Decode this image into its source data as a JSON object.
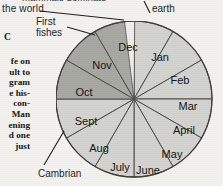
{
  "page": {
    "background_color": "#f3f2ef",
    "ink_color": "#1d1d1b"
  },
  "body_text": {
    "clipped_top_line": "mammals dominate",
    "visible_line": "the world."
  },
  "left_column": {
    "stray_letter": "C",
    "lines": [
      "fe  on",
      "ult  to",
      "gram",
      "e  his-",
      "con-",
      "Man",
      "ening",
      "d  one",
      "just"
    ]
  },
  "callouts": [
    {
      "name": "earth",
      "label": "earth"
    },
    {
      "name": "first-fishes",
      "label_line1": "First",
      "label_line2": "fishes"
    },
    {
      "name": "cambrian",
      "label": "Cambrian"
    }
  ],
  "chart_data": {
    "type": "pie",
    "title": "",
    "legend_position": "in-slice",
    "note": "Geologic time compressed into one calendar year; twelve equal monthly slices.",
    "slice_value": 1,
    "total": 12,
    "start_angle_deg": -90,
    "direction": "clockwise",
    "categories": [
      "Jan",
      "Feb",
      "Mar",
      "April",
      "May",
      "June",
      "July",
      "Aug",
      "Sept",
      "Oct",
      "Nov",
      "Dec"
    ],
    "values": [
      1,
      1,
      1,
      1,
      1,
      1,
      1,
      1,
      1,
      1,
      1,
      1
    ],
    "percentages": [
      8.33,
      8.33,
      8.33,
      8.33,
      8.33,
      8.33,
      8.33,
      8.33,
      8.33,
      8.33,
      8.33,
      8.33
    ],
    "colors": {
      "light": "#d2d2ce",
      "dark": "#a8a8a2",
      "highlight": "#efeeea",
      "stroke": "#4d4d4a"
    },
    "slices": [
      {
        "label": "Jan",
        "value": 1,
        "shade": "light",
        "fill": "#d2d2ce",
        "label_x": 104,
        "label_y": 37
      },
      {
        "label": "Feb",
        "value": 1,
        "shade": "light",
        "fill": "#d2d2ce",
        "label_x": 124,
        "label_y": 60
      },
      {
        "label": "Mar",
        "value": 1,
        "shade": "light",
        "fill": "#d2d2ce",
        "label_x": 132,
        "label_y": 86
      },
      {
        "label": "April",
        "value": 1,
        "shade": "light",
        "fill": "#d2d2ce",
        "label_x": 128,
        "label_y": 110
      },
      {
        "label": "May",
        "value": 1,
        "shade": "light",
        "fill": "#d2d2ce",
        "label_x": 116,
        "label_y": 134
      },
      {
        "label": "June",
        "value": 1,
        "shade": "light",
        "fill": "#d2d2ce",
        "label_x": 92,
        "label_y": 150
      },
      {
        "label": "July",
        "value": 1,
        "shade": "light",
        "fill": "#d2d2ce",
        "label_x": 64,
        "label_y": 147
      },
      {
        "label": "Aug",
        "value": 1,
        "shade": "light",
        "fill": "#d2d2ce",
        "label_x": 43,
        "label_y": 128
      },
      {
        "label": "Sept",
        "value": 1,
        "shade": "light",
        "fill": "#d2d2ce",
        "label_x": 30,
        "label_y": 101
      },
      {
        "label": "Oct",
        "value": 1,
        "shade": "dark",
        "fill": "#a8a8a2",
        "label_x": 28,
        "label_y": 72
      },
      {
        "label": "Nov",
        "value": 1,
        "shade": "dark",
        "fill": "#a8a8a2",
        "label_x": 46,
        "label_y": 45
      },
      {
        "label": "Dec",
        "value": 1,
        "shade": "dark",
        "fill": "#a8a8a2",
        "label_x": 72,
        "label_y": 27
      }
    ],
    "extra_sliver": {
      "label": "",
      "shade": "highlight",
      "fill": "#efeeea"
    }
  }
}
